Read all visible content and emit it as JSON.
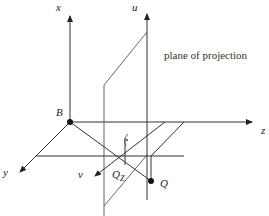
{
  "diagram": {
    "caption": "plane of projection",
    "labels": {
      "x_axis": "x",
      "u_axis": "u",
      "z_axis": "z",
      "y_axis": "y",
      "v_axis": "v",
      "origin": "B",
      "point_q": "Q",
      "point_qz_main": "Q",
      "point_qz_sub": "Z"
    },
    "colors": {
      "line": "#333333",
      "point": "#111111"
    }
  }
}
